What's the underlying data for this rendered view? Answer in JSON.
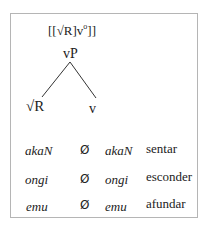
{
  "diagram": {
    "formula": {
      "prefix": "[[√R]v",
      "superscript": "o",
      "suffix": "]]"
    },
    "tree": {
      "root": "vP",
      "left_child": "√R",
      "right_child": "v"
    }
  },
  "table": {
    "rows": [
      {
        "root": "akaN",
        "affix": "Ø",
        "form": "akaN",
        "gloss": "sentar"
      },
      {
        "root": "ongi",
        "affix": "Ø",
        "form": "ongi",
        "gloss": "esconder"
      },
      {
        "root": "emu",
        "affix": "Ø",
        "form": "emu",
        "gloss": "afundar"
      }
    ]
  },
  "colors": {
    "border": "#b5b5b5",
    "text": "#222222",
    "lines": "#333333"
  }
}
